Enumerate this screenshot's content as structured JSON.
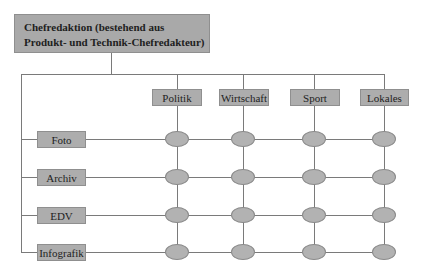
{
  "diagram": {
    "type": "matrix-organization",
    "root": {
      "label_line1": "Chefredaktion (bestehend aus",
      "label_line2": "Produkt- und Technik-Chefredakteur)"
    },
    "columns": [
      {
        "label": "Politik",
        "cx": 177
      },
      {
        "label": "Wirtschaft",
        "cx": 243
      },
      {
        "label": "Sport",
        "cx": 314
      },
      {
        "label": "Lokales",
        "cx": 384
      }
    ],
    "rows": [
      {
        "label": "Foto",
        "cy": 139
      },
      {
        "label": "Archiv",
        "cy": 177
      },
      {
        "label": "EDV",
        "cy": 215
      },
      {
        "label": "Infografik",
        "cy": 252
      }
    ],
    "colors": {
      "box_fill": "#adadad",
      "node_fill": "#b2b2b2",
      "line": "#7a7a7a",
      "text": "#1e1e1e"
    }
  }
}
